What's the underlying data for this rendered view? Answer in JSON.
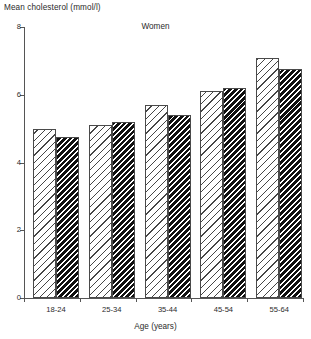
{
  "chart_data": {
    "type": "bar",
    "title": "Women",
    "xlabel": "Age (years)",
    "ylabel": "Mean cholesterol (mmol/l)",
    "categories": [
      "18-24",
      "25-34",
      "35-44",
      "45-54",
      "55-64"
    ],
    "series": [
      {
        "name": "light-hatched",
        "values": [
          5.0,
          5.1,
          5.7,
          6.1,
          7.1
        ]
      },
      {
        "name": "dark-hatched",
        "values": [
          4.75,
          5.2,
          5.4,
          6.2,
          6.75
        ]
      }
    ],
    "ylim": [
      0,
      8
    ],
    "ytick_labels": [
      "0",
      "2",
      "4",
      "6",
      "8"
    ],
    "ytick_values": [
      0,
      2,
      4,
      6,
      8
    ],
    "grid": false,
    "legend": "none",
    "colors": {
      "axis": "#555555",
      "text": "#2b2b2b",
      "bar_outline": "#4a4a4a",
      "light_bar_fill": "#ffffff",
      "dark_bar_hatch": "#111111",
      "background": "#ffffff"
    }
  }
}
